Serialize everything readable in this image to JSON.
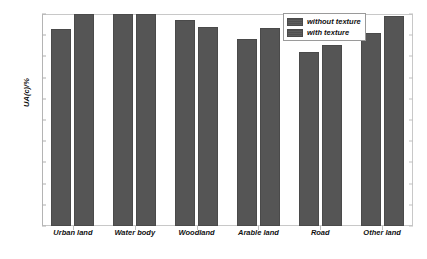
{
  "chart_data": {
    "type": "bar",
    "title": "",
    "subtitle": "",
    "xlabel": "",
    "ylabel": "UA(c)/%",
    "ylim": [
      0,
      100
    ],
    "ytick_step": 10,
    "ytick_labels": [
      "100",
      "90",
      "80",
      "70",
      "60",
      "50",
      "40",
      "30",
      "20",
      "10",
      "0"
    ],
    "ytick_values": [
      100,
      90,
      80,
      70,
      60,
      50,
      40,
      30,
      20,
      10,
      0
    ],
    "grid": false,
    "legend_position": "top-right",
    "categories": [
      "Urban land",
      "Water body",
      "Woodland",
      "Arable land",
      "Road",
      "Other land"
    ],
    "series": [
      {
        "name": "without texture",
        "color": "#555555",
        "values": [
          93,
          100,
          97,
          88,
          82,
          91
        ]
      },
      {
        "name": "with texture",
        "color": "#555555",
        "values": [
          100,
          100,
          94,
          93.5,
          85.5,
          99
        ]
      }
    ],
    "annotations": []
  },
  "legend": {
    "items": [
      {
        "label": "without texture"
      },
      {
        "label": "with texture"
      }
    ]
  },
  "colors": {
    "bar_fill": "#555555",
    "bar_edge": "#4a4a4a",
    "axis_frame": "#c8c8c8",
    "background": "#ffffff",
    "text": "#111111"
  }
}
